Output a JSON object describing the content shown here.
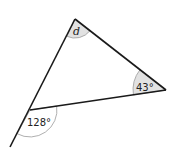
{
  "diagram": {
    "type": "triangle-angles",
    "vertices": {
      "top": {
        "x": 75,
        "y": 19
      },
      "right": {
        "x": 166,
        "y": 90
      },
      "bottom_left": {
        "x": 30,
        "y": 110
      }
    },
    "extension_end": {
      "x": 10,
      "y": 147
    },
    "angles": [
      {
        "vertex": "top",
        "label": "d",
        "kind": "interior",
        "shaded": true
      },
      {
        "vertex": "right",
        "label": "43°",
        "kind": "interior",
        "shaded": true
      },
      {
        "vertex": "bottom_left",
        "label": "128°",
        "kind": "exterior",
        "shaded": false
      }
    ],
    "colors": {
      "line": "#1a1a1a",
      "arc_fill": "#e2e2e2",
      "arc_stroke": "#9a9a9a",
      "background": "#ffffff"
    }
  }
}
